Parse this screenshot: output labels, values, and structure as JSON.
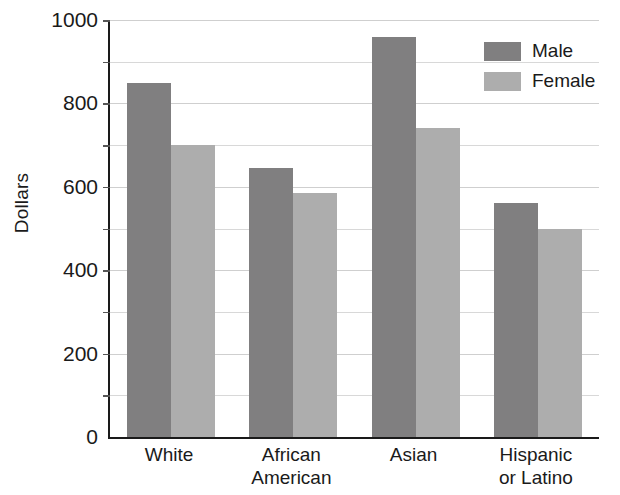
{
  "chart_data": {
    "type": "bar",
    "title": "",
    "xlabel": "",
    "ylabel": "Dollars",
    "categories": [
      "White",
      "African American",
      "Asian",
      "Hispanic or Latino"
    ],
    "category_lines": [
      [
        "White"
      ],
      [
        "African",
        "American"
      ],
      [
        "Asian"
      ],
      [
        "Hispanic",
        "or Latino"
      ]
    ],
    "series": [
      {
        "name": "Male",
        "color": "#807f80",
        "values": [
          850,
          645,
          960,
          560
        ]
      },
      {
        "name": "Female",
        "color": "#adadad",
        "values": [
          700,
          585,
          740,
          500
        ]
      }
    ],
    "ylim": [
      0,
      1000
    ],
    "ytick_labels": [
      "0",
      "200",
      "400",
      "600",
      "800",
      "1000"
    ],
    "ytick_values": [
      0,
      200,
      400,
      600,
      800,
      1000
    ],
    "gridline_values": [
      100,
      200,
      300,
      400,
      500,
      600,
      700,
      800,
      900,
      1000
    ],
    "grid": true,
    "legend_position": "top-right",
    "legend_entries": [
      "Male",
      "Female"
    ]
  }
}
